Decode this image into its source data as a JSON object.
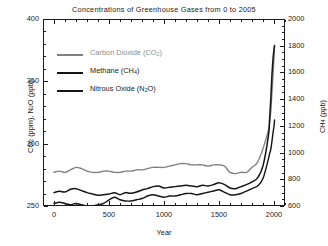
{
  "chart_data": {
    "type": "line",
    "title": "Concentrations of Greenhouse Gases from 0 to 2005",
    "xlabel": "Year",
    "ylabel_left": "CO2 (ppm), N2O (ppb)",
    "ylabel_right": "CH4 (ppb)",
    "xlim": [
      -100,
      2100
    ],
    "ylim_left": [
      250,
      400
    ],
    "ylim_right": [
      600,
      2000
    ],
    "xticks": [
      0,
      500,
      1000,
      1500,
      2000
    ],
    "yticks_left": [
      250,
      300,
      350,
      400
    ],
    "yticks_right": [
      600,
      800,
      1000,
      1200,
      1400,
      1600,
      1800,
      2000
    ],
    "grid": false,
    "legend_position": "upper-left-inside",
    "series": [
      {
        "name": "Carbon Dioxide (CO2)",
        "axis": "left",
        "units": "ppm",
        "color": "#808080",
        "x": [
          0,
          50,
          100,
          150,
          200,
          250,
          300,
          350,
          400,
          450,
          500,
          550,
          600,
          650,
          700,
          750,
          800,
          850,
          900,
          950,
          1000,
          1050,
          1100,
          1150,
          1200,
          1250,
          1300,
          1350,
          1400,
          1450,
          1500,
          1550,
          1600,
          1650,
          1700,
          1750,
          1800,
          1850,
          1900,
          1950,
          1960,
          1970,
          1980,
          1990,
          2000,
          2005
        ],
        "values": [
          277,
          278,
          277,
          279,
          281,
          280,
          278,
          277,
          277,
          278,
          278,
          277,
          277,
          278,
          278,
          279,
          279,
          280,
          281,
          281,
          281,
          282,
          283,
          284,
          284,
          283,
          283,
          283,
          282,
          283,
          283,
          282,
          277,
          276,
          277,
          277,
          281,
          285,
          296,
          311,
          317,
          325,
          339,
          354,
          369,
          379
        ]
      },
      {
        "name": "Methane (CH4)",
        "axis": "right",
        "units": "ppb",
        "color": "#141414",
        "x": [
          0,
          50,
          100,
          150,
          200,
          250,
          300,
          350,
          400,
          450,
          500,
          550,
          600,
          650,
          700,
          750,
          800,
          850,
          900,
          950,
          1000,
          1050,
          1100,
          1150,
          1200,
          1250,
          1300,
          1350,
          1400,
          1450,
          1500,
          1550,
          1600,
          1650,
          1700,
          1750,
          1800,
          1850,
          1900,
          1950,
          1960,
          1970,
          1980,
          1990,
          2000,
          2005
        ],
        "values": [
          700,
          710,
          705,
          725,
          730,
          715,
          700,
          690,
          680,
          685,
          690,
          700,
          685,
          700,
          695,
          705,
          720,
          730,
          745,
          750,
          735,
          740,
          745,
          750,
          755,
          750,
          745,
          755,
          750,
          760,
          775,
          760,
          735,
          730,
          745,
          760,
          780,
          810,
          900,
          1130,
          1250,
          1390,
          1560,
          1690,
          1775,
          1800
        ]
      },
      {
        "name": "Nitrous Oxide (N2O)",
        "axis": "left",
        "units": "ppb",
        "color": "#141414",
        "x": [
          0,
          50,
          100,
          150,
          200,
          250,
          300,
          350,
          400,
          450,
          500,
          550,
          600,
          650,
          700,
          750,
          800,
          850,
          900,
          950,
          1000,
          1050,
          1100,
          1150,
          1200,
          1250,
          1300,
          1350,
          1400,
          1450,
          1500,
          1550,
          1600,
          1650,
          1700,
          1750,
          1800,
          1850,
          1900,
          1950,
          1960,
          1970,
          1980,
          1990,
          2000,
          2005
        ],
        "values": [
          252,
          253,
          252,
          251,
          252,
          251,
          250,
          250,
          251,
          252,
          255,
          257,
          255,
          254,
          254,
          255,
          256,
          258,
          259,
          258,
          257,
          258,
          258,
          259,
          260,
          260,
          259,
          260,
          261,
          262,
          263,
          261,
          259,
          259,
          260,
          262,
          264,
          266,
          272,
          288,
          292,
          295,
          301,
          308,
          314,
          319
        ]
      }
    ]
  },
  "title": {
    "text": "Concentrations of Greenhouse Gases from 0 to 2005"
  },
  "axes": {
    "x_label": "Year",
    "y_left_label_parts": {
      "a": "CO",
      "sub1": "2",
      "b": " (ppm), N",
      "sub2": "2",
      "c": "O (ppb)"
    },
    "y_right_label_parts": {
      "a": "CH",
      "sub1": "4",
      "b": " (ppb)"
    },
    "x_ticks": [
      "0",
      "500",
      "1000",
      "1500",
      "2000"
    ],
    "y_left_ticks": [
      "400",
      "350",
      "300",
      "250"
    ],
    "y_right_ticks": [
      "2000",
      "1800",
      "1600",
      "1400",
      "1200",
      "1000",
      "800",
      "600"
    ]
  },
  "legend": {
    "items": [
      {
        "label_a": "Carbon Dioxide (CO",
        "sub": "2",
        "label_b": ")",
        "color": "#808080"
      },
      {
        "label_a": "Methane (CH",
        "sub": "4",
        "label_b": ")",
        "color": "#141414"
      },
      {
        "label_a": "Nitrous Oxide (N",
        "sub": "2",
        "label_b": "O)",
        "color": "#141414"
      }
    ]
  },
  "colors": {
    "co2": "#808080",
    "ch4": "#141414",
    "n2o": "#141414",
    "axis": "#1a1a1a",
    "background": "#ffffff"
  }
}
